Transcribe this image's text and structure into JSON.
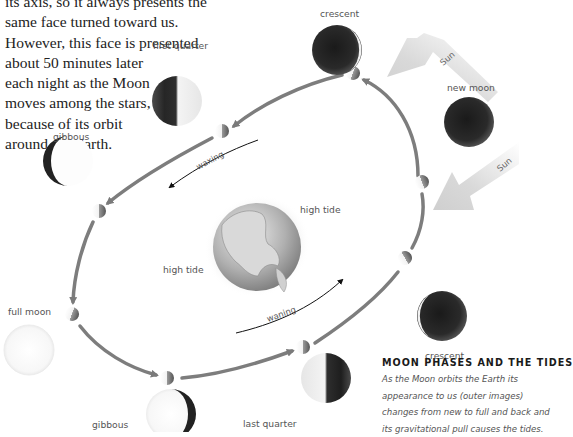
{
  "intro_text": {
    "lines": [
      "its axis, so it always presents the",
      "same face turned toward us.",
      "However, this face is presented",
      "about 50 minutes later",
      "each night as the Moon",
      "moves among the stars,",
      "because of its orbit",
      "around the Earth."
    ]
  },
  "phases": {
    "first_quarter": "first quarter",
    "crescent_top": "crescent",
    "new_moon": "new moon",
    "gibbous_left": "gibbous",
    "full_moon": "full moon",
    "gibbous_bottom": "gibbous",
    "last_quarter": "last quarter",
    "crescent_right": "crescent"
  },
  "sun_labels": [
    "Sun",
    "Sun"
  ],
  "orbit_labels": {
    "waxing": "waxing",
    "waning": "waning"
  },
  "earth_labels": {
    "high_tide_right": "high tide",
    "high_tide_left": "high tide"
  },
  "caption": {
    "title": "MOON PHASES AND THE TIDES",
    "body_lines": [
      "As the Moon orbits the Earth its",
      "appearance to us (outer images)",
      "changes from new to full and back and",
      "its gravitational pull causes the tides."
    ]
  },
  "colors": {
    "orbit": "#7a7a7a",
    "sun_arrow": "#d8d8d8",
    "moon_dark": "#1e1e1e",
    "moon_light": "#f4f4f4",
    "text": "#222222"
  }
}
